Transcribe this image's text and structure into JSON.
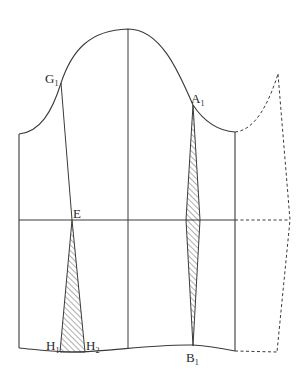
{
  "diagram": {
    "type": "sleeve pattern draft",
    "colors": {
      "line": "#3a3a3a",
      "hatch": "#3a3a3a",
      "background": "#ffffff"
    },
    "labels": {
      "g1": {
        "main": "G",
        "sub": "1"
      },
      "a1": {
        "main": "A",
        "sub": "1"
      },
      "e": {
        "main": "E",
        "sub": ""
      },
      "h1": {
        "main": "H",
        "sub": "1"
      },
      "h2": {
        "main": "H",
        "sub": "2"
      },
      "b1": {
        "main": "B",
        "sub": "1"
      }
    },
    "points": {
      "crown_top": [
        128,
        29
      ],
      "g1": [
        61,
        83
      ],
      "a1": [
        193,
        105
      ],
      "e": [
        72,
        220
      ],
      "h1": [
        60,
        352
      ],
      "h2": [
        85,
        352
      ],
      "b1": [
        193,
        346
      ],
      "dashed_peak": [
        278,
        74
      ]
    }
  }
}
